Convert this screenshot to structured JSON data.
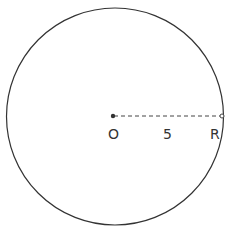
{
  "diagram": {
    "type": "circle-radius",
    "circle": {
      "cx": 115,
      "cy": 116.5,
      "r": 108,
      "stroke": "#333333"
    },
    "center_point": {
      "label": "O",
      "x": 113,
      "y": 116,
      "color": "#333333"
    },
    "radius_end_point": {
      "x": 222,
      "y": 116,
      "style": "open-circle"
    },
    "radius_line": {
      "style": "dashed",
      "length_label": "5"
    },
    "labels": {
      "center": "O",
      "length": "5",
      "radius": "R"
    }
  }
}
